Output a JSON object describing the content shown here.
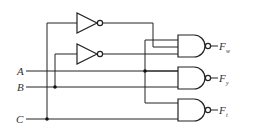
{
  "diagram": {
    "type": "logic-circuit",
    "inputs": [
      {
        "id": "A",
        "label": "A"
      },
      {
        "id": "B",
        "label": "B"
      },
      {
        "id": "C",
        "label": "C"
      }
    ],
    "outputs": [
      {
        "id": "Fw",
        "label": "F",
        "subscript": "w"
      },
      {
        "id": "Fy",
        "label": "F",
        "subscript": "y"
      },
      {
        "id": "Fx",
        "label": "F",
        "subscript": "t"
      }
    ],
    "gates": [
      {
        "id": "inv1",
        "type": "NOT",
        "input": "C"
      },
      {
        "id": "inv2",
        "type": "NOT",
        "input": "B"
      },
      {
        "id": "nand1",
        "type": "NAND",
        "inputs": [
          "inv1",
          "inv2",
          "A"
        ],
        "output": "Fw"
      },
      {
        "id": "nand2",
        "type": "NAND",
        "inputs": [
          "A",
          "B"
        ],
        "output": "Fy"
      },
      {
        "id": "nand3",
        "type": "NAND",
        "inputs": [
          "A",
          "C"
        ],
        "output": "Fx"
      }
    ]
  }
}
